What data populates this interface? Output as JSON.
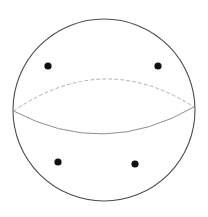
{
  "figure": {
    "width": 208,
    "height": 217,
    "background_color": "#ffffff"
  },
  "chart_data": {
    "type": "scatter",
    "title": "",
    "subtitle": "",
    "xlabel": "",
    "ylabel": "",
    "xlim": [
      0,
      208
    ],
    "ylim": [
      0,
      217
    ],
    "grid": false,
    "legend": null,
    "annotations": [],
    "shapes": [
      {
        "name": "sphere-outline",
        "kind": "circle",
        "cx": 104,
        "cy": 110,
        "r": 91,
        "stroke": "#4d4d4d",
        "stroke_width": 1.1,
        "fill": "none",
        "dashed": false
      },
      {
        "name": "equator-back-half",
        "kind": "arc",
        "from": [
          13.5,
          111
        ],
        "to": [
          194,
          107
        ],
        "apex": [
          104,
          79
        ],
        "stroke": "#b0b0b0",
        "stroke_width": 1.0,
        "fill": "none",
        "dashed": true,
        "dash_pattern": "3 3"
      },
      {
        "name": "equator-front-half",
        "kind": "arc",
        "from": [
          13.5,
          111
        ],
        "to": [
          194,
          107
        ],
        "apex": [
          104,
          134
        ],
        "stroke": "#8f8f8f",
        "stroke_width": 1.0,
        "fill": "none",
        "dashed": false
      }
    ],
    "points": [
      {
        "name": "point-upper-left",
        "x": 48,
        "y": 66,
        "r": 3.6,
        "color": "#111111"
      },
      {
        "name": "point-upper-right",
        "x": 158,
        "y": 66,
        "r": 3.6,
        "color": "#111111"
      },
      {
        "name": "point-lower-left",
        "x": 58,
        "y": 162,
        "r": 3.6,
        "color": "#111111"
      },
      {
        "name": "point-lower-right",
        "x": 135,
        "y": 164,
        "r": 3.6,
        "color": "#111111"
      }
    ],
    "x": [
      48,
      158,
      58,
      135
    ],
    "values": [
      66,
      66,
      162,
      164
    ],
    "colors": {
      "point": "#111111",
      "outline": "#4d4d4d",
      "equator_front": "#8f8f8f",
      "equator_back": "#b0b0b0",
      "background": "#ffffff"
    }
  }
}
